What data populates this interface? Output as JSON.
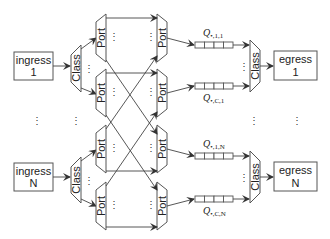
{
  "diagram": {
    "ingress": [
      {
        "line1": "ingress",
        "line2": "1"
      },
      {
        "line1": "ingress",
        "line2": "N"
      }
    ],
    "egress": [
      {
        "line1": "egress",
        "line2": "1"
      },
      {
        "line1": "egress",
        "line2": "N"
      }
    ],
    "class_label": "Class",
    "port_label": "Port",
    "ellipsis_h": "⋮",
    "queues": [
      {
        "label_main": "Q",
        "label_sub": "•,1,1",
        "position": "above"
      },
      {
        "label_main": "Q",
        "label_sub": "•,C,1",
        "position": "below"
      },
      {
        "label_main": "Q",
        "label_sub": "•,1,N",
        "position": "above"
      },
      {
        "label_main": "Q",
        "label_sub": "•,C,N",
        "position": "below"
      }
    ],
    "vertical_dots": "⋮"
  }
}
